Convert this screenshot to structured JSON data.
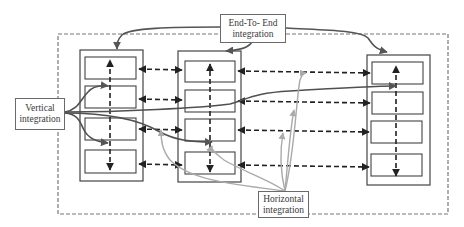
{
  "diagram": {
    "labels": {
      "end_to_end": "End-To- End integration",
      "vertical": "Vertical integration",
      "horizontal": "Horizontal integration"
    },
    "colors": {
      "box_stroke": "#444444",
      "dashed_boundary": "#777777",
      "dashed_arrows": "#222222",
      "end_to_end_curves": "#555555",
      "vertical_curves": "#505050",
      "horizontal_curves": "#aaaaaa"
    },
    "columns": [
      {
        "id": "column-1",
        "layers": 4
      },
      {
        "id": "column-2",
        "layers": 4
      },
      {
        "id": "column-3",
        "layers": 4
      }
    ]
  }
}
